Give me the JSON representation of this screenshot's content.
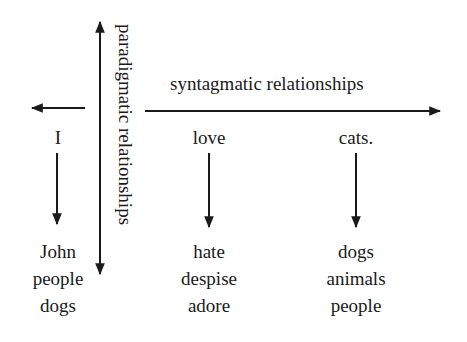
{
  "diagram": {
    "vertical_axis_label": "paradigmatic relationships",
    "horizontal_axis_label": "syntagmatic relationships",
    "colors": {
      "ink": "#1a1a1a",
      "background": "#ffffff"
    },
    "columns": [
      {
        "head": "I",
        "alternatives": [
          "John",
          "people",
          "dogs"
        ]
      },
      {
        "head": "love",
        "alternatives": [
          "hate",
          "despise",
          "adore"
        ]
      },
      {
        "head": "cats.",
        "alternatives": [
          "dogs",
          "animals",
          "people"
        ]
      }
    ]
  }
}
